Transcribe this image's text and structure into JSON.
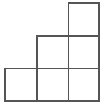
{
  "figure": {
    "shape_name": "staircase-polyomino",
    "square_count": 6,
    "background_color": "#ffffff",
    "line_color": "#555555",
    "fill_color": "#ffffff",
    "line_width": 1.6,
    "canvas": {
      "width": 105,
      "height": 111
    },
    "grid": {
      "columns_x": [
        5,
        36.7,
        68.3,
        99
      ],
      "rows_y": [
        3,
        35.7,
        68.3,
        101
      ],
      "column_count": 3,
      "row_count": 3
    },
    "cells": [
      {
        "name": "cell-r0-c2",
        "row": 0,
        "col": 2,
        "x": 68.3,
        "y": 3,
        "width": 30.7,
        "height": 32.7,
        "filled": true
      },
      {
        "name": "cell-r1-c1",
        "row": 1,
        "col": 1,
        "x": 36.7,
        "y": 35.7,
        "width": 31.6,
        "height": 32.6,
        "filled": true
      },
      {
        "name": "cell-r1-c2",
        "row": 1,
        "col": 2,
        "x": 68.3,
        "y": 35.7,
        "width": 30.7,
        "height": 32.6,
        "filled": true
      },
      {
        "name": "cell-r2-c0",
        "row": 2,
        "col": 0,
        "x": 5,
        "y": 68.3,
        "width": 31.7,
        "height": 32.7,
        "filled": true
      },
      {
        "name": "cell-r2-c1",
        "row": 2,
        "col": 1,
        "x": 36.7,
        "y": 68.3,
        "width": 31.6,
        "height": 32.7,
        "filled": true
      },
      {
        "name": "cell-r2-c2",
        "row": 2,
        "col": 2,
        "x": 68.3,
        "y": 68.3,
        "width": 30.7,
        "height": 32.7,
        "filled": true
      }
    ],
    "outline_path": "M 68.3 3 L 99 3 L 99 101 L 5 101 L 5 68.3 L 36.7 68.3 L 36.7 35.7 L 68.3 35.7 Z",
    "interior_segments": [
      {
        "name": "interior-horizontal-top",
        "x1": 68.3,
        "y1": 35.7,
        "x2": 99,
        "y2": 35.7
      },
      {
        "name": "interior-horizontal-bottom",
        "x1": 36.7,
        "y1": 68.3,
        "x2": 99,
        "y2": 68.3
      },
      {
        "name": "interior-vertical-middle",
        "x1": 68.3,
        "y1": 35.7,
        "x2": 68.3,
        "y2": 101
      },
      {
        "name": "interior-vertical-left",
        "x1": 36.7,
        "y1": 68.3,
        "x2": 36.7,
        "y2": 101
      }
    ]
  }
}
